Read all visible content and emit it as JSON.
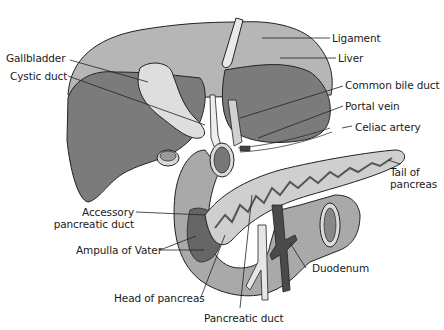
{
  "diagram": {
    "labels": {
      "ligament": "Ligament",
      "liver": "Liver",
      "gallbladder": "Gallbladder",
      "cystic_duct": "Cystic duct",
      "common_bile_duct": "Common bile duct",
      "portal_vein": "Portal vein",
      "celiac_artery": "Celiac artery",
      "tail_of_pancreas_1": "Tail of",
      "tail_of_pancreas_2": "pancreas",
      "accessory_pancreatic_duct_1": "Accessory",
      "accessory_pancreatic_duct_2": "pancreatic duct",
      "ampulla_of_vater": "Ampulla of Vater",
      "duodenum": "Duodenum",
      "head_of_pancreas": "Head of pancreas",
      "pancreatic_duct": "Pancreatic duct"
    },
    "colors": {
      "liver_light": "#b4b4b4",
      "liver_dark": "#7a7a7a",
      "gallbladder": "#dcdcdc",
      "duodenum": "#a8a8a8",
      "pancreas": "#cfcfcf",
      "vein_dark": "#5a5a5a",
      "outline": "#222222"
    }
  }
}
